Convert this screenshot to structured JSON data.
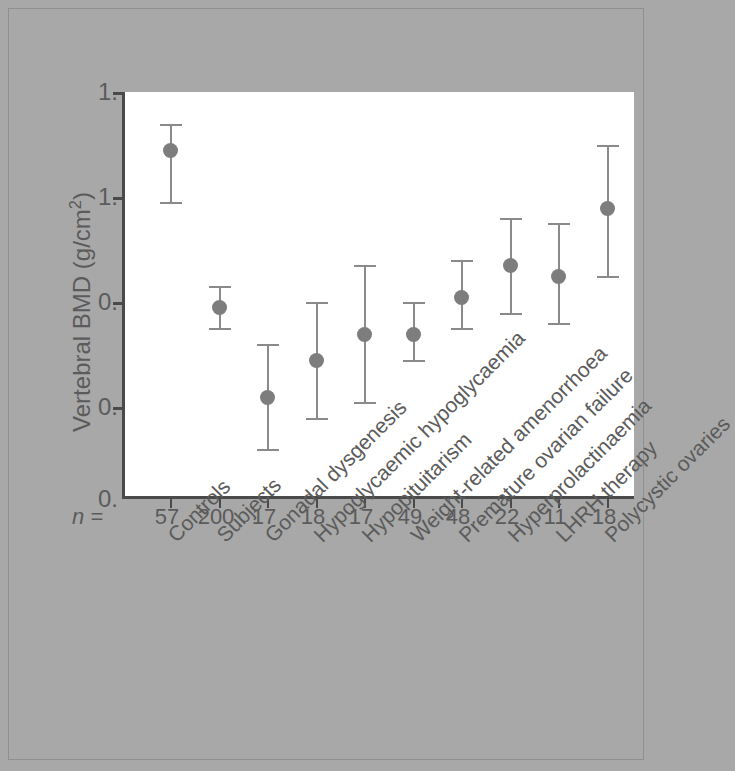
{
  "chart_data": {
    "type": "scatter",
    "title": "",
    "subtitle": "",
    "xlabel": "",
    "ylabel": "Vertebral BMD (g/cm2)",
    "ylabel_parts": {
      "main": "Vertebral BMD (g/cm",
      "sup": "2",
      "tail": ")"
    },
    "ylim": [
      0.6,
      1.4
    ],
    "ytick_labels": [
      "1.4",
      "1.2",
      "1.0",
      "0.8",
      "0.6"
    ],
    "ytick_values": [
      1.4,
      1.2,
      1.0,
      0.8,
      0.6
    ],
    "ytick_labels_as_rendered": [
      "1.",
      "1.",
      "0.",
      "0.",
      "0."
    ],
    "grid": false,
    "legend": "none",
    "error_bar_type": "mean with error bars",
    "n_row_label": "n =",
    "categories": [
      "Controls",
      "Subjects",
      "Gonadal dysgenesis",
      "Hypoglycaemic hypoglycaemia",
      "Hypopituitarism",
      "Weight-related amenorrhoea",
      "Premature ovarian failure",
      "Hyperprolactinaemia",
      "LHRH therapy",
      "Polycystic ovaries"
    ],
    "n_values": [
      57,
      200,
      17,
      18,
      17,
      49,
      48,
      22,
      11,
      18
    ],
    "values": [
      1.29,
      0.99,
      0.82,
      0.89,
      0.94,
      0.94,
      1.01,
      1.07,
      1.05,
      1.18
    ],
    "err_low": [
      1.19,
      0.95,
      0.72,
      0.78,
      0.81,
      0.89,
      0.95,
      0.98,
      0.96,
      1.05
    ],
    "err_high": [
      1.34,
      1.03,
      0.92,
      1.0,
      1.07,
      1.0,
      1.08,
      1.16,
      1.15,
      1.3
    ],
    "series": [
      {
        "name": "Vertebral BMD",
        "points": [
          {
            "category": "Controls",
            "n": 57,
            "mean": 1.29,
            "low": 1.19,
            "high": 1.34
          },
          {
            "category": "Subjects",
            "n": 200,
            "mean": 0.99,
            "low": 0.95,
            "high": 1.03
          },
          {
            "category": "Gonadal dysgenesis",
            "n": 17,
            "mean": 0.82,
            "low": 0.72,
            "high": 0.92
          },
          {
            "category": "Hypoglycaemic hypoglycaemia",
            "n": 18,
            "mean": 0.89,
            "low": 0.78,
            "high": 1.0
          },
          {
            "category": "Hypopituitarism",
            "n": 17,
            "mean": 0.94,
            "low": 0.81,
            "high": 1.07
          },
          {
            "category": "Weight-related amenorrhoea",
            "n": 49,
            "mean": 0.94,
            "low": 0.89,
            "high": 1.0
          },
          {
            "category": "Premature ovarian failure",
            "n": 48,
            "mean": 1.01,
            "low": 0.95,
            "high": 1.08
          },
          {
            "category": "Hyperprolactinaemia",
            "n": 22,
            "mean": 1.07,
            "low": 0.98,
            "high": 1.16
          },
          {
            "category": "LHRH therapy",
            "n": 11,
            "mean": 1.05,
            "low": 0.96,
            "high": 1.15
          },
          {
            "category": "Polycystic ovaries",
            "n": 18,
            "mean": 1.18,
            "low": 1.05,
            "high": 1.3
          }
        ]
      }
    ],
    "colors": {
      "background": "#a8a8a8",
      "plot_background": "#ffffff",
      "axis": "#4a4a4a",
      "marker": "#7d7d7d",
      "error_bar": "#8a8a8a",
      "text": "#5b5b5b"
    }
  }
}
